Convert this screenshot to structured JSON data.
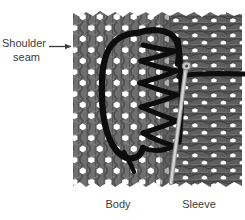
{
  "figure": {
    "title_visible": false,
    "background_color": "#ffffff",
    "callout": {
      "label_line1": "Shoulder",
      "label_line2": "seam",
      "arrow_direction": "right",
      "arrow_color": "#3b3b3b",
      "text_color": "#3b3b3b"
    },
    "labels": {
      "left": "Body",
      "right": "Sleeve",
      "color": "#3b3b3b"
    },
    "fabric": {
      "body_panel": {
        "name": "Body",
        "knit_orientation": "vertical-rib",
        "yarn_color": "#6e6e6e",
        "shadow_color": "#4a4a4a",
        "hole_color": "#ffffff"
      },
      "sleeve_panel": {
        "name": "Sleeve",
        "knit_orientation": "horizontal-course",
        "yarn_color": "#5a5a5a",
        "shadow_color": "#3c3c3c",
        "hole_color": "#ffffff"
      }
    },
    "thread": {
      "name": "seaming-yarn",
      "color": "#0d0d0d",
      "stitch_type": "zigzag-loop-seam"
    },
    "needle": {
      "name": "sewing-needle",
      "color": "#c9c9c9",
      "outline_color": "#8a8a8a"
    }
  }
}
